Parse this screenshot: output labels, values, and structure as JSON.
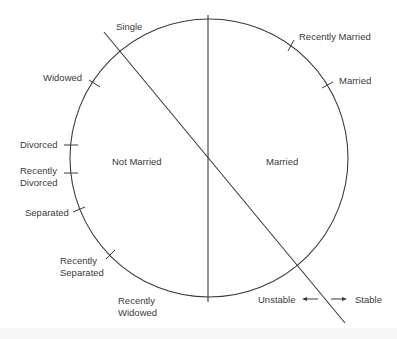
{
  "diagram": {
    "type": "marital-status-cycle",
    "regions": {
      "left": "Not Married",
      "right": "Married"
    },
    "axis_label_top": "Single",
    "states": [
      {
        "id": "recently-married",
        "label": "Recently Married"
      },
      {
        "id": "married",
        "label": "Married"
      },
      {
        "id": "widowed",
        "label": "Widowed"
      },
      {
        "id": "divorced",
        "label": "Divorced"
      },
      {
        "id": "recently-divorced",
        "line1": "Recently",
        "line2": "Divorced"
      },
      {
        "id": "separated",
        "label": "Separated"
      },
      {
        "id": "recently-separated",
        "line1": "Recently",
        "line2": "Separated"
      },
      {
        "id": "recently-widowed",
        "line1": "Recently",
        "line2": "Widowed"
      }
    ],
    "stability_axis": {
      "left": "Unstable",
      "right": "Stable"
    },
    "colors": {
      "ink": "#3a3a3a",
      "background": "#ffffff"
    }
  }
}
